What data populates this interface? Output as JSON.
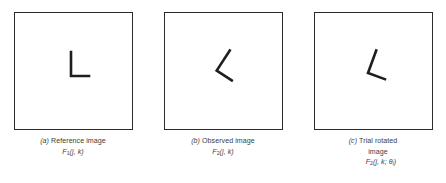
{
  "figure": {
    "type": "technical-illustration",
    "background_color": "#ffffff",
    "border_color": "#2b2b2b",
    "stroke_color": "#1e1e1e",
    "text_color": "#3d3d3d",
    "panels": [
      {
        "id": "a",
        "index_label": "(a)",
        "caption_line_1": "Reference image",
        "caption_line_2": "",
        "formula_base": "F",
        "formula_subscript": "1",
        "formula_args": "(j, k)",
        "glyph": "L-shape",
        "rotation_degrees": 0
      },
      {
        "id": "b",
        "index_label": "(b)",
        "caption_line_1": "Observed image",
        "caption_line_2": "",
        "formula_base": "F",
        "formula_subscript": "2",
        "formula_args": "(j, k)",
        "glyph": "L-shape",
        "rotation_degrees": 33
      },
      {
        "id": "c",
        "index_label": "(c)",
        "caption_line_1": "Trial rotated",
        "caption_line_2": "image",
        "formula_base": "F",
        "formula_subscript": "2",
        "formula_args": "(j, k; θ",
        "formula_args_sub": "i",
        "formula_args_close": ")",
        "glyph": "L-shape",
        "rotation_degrees": 20
      }
    ]
  }
}
